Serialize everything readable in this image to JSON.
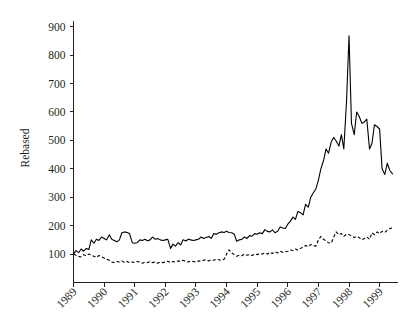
{
  "chart_data": {
    "type": "line",
    "title": "",
    "subtitle": "",
    "xlabel": "",
    "ylabel": "Rebased",
    "xlim": [
      1989.0,
      1999.6
    ],
    "ylim": [
      0,
      920
    ],
    "yticks": [
      100,
      200,
      300,
      400,
      500,
      600,
      700,
      800,
      900
    ],
    "ytick_labels": [
      "100",
      "200",
      "300",
      "400",
      "500",
      "600",
      "700",
      "800",
      "900"
    ],
    "xticks": [
      1989,
      1990,
      1991,
      1992,
      1993,
      1994,
      1995,
      1996,
      1997,
      1998,
      1999
    ],
    "xtick_labels": [
      "1989",
      "1990",
      "1991",
      "1992",
      "1993",
      "1994",
      "1995",
      "1996",
      "1997",
      "1998",
      "1999"
    ],
    "xtick_rotation_deg": 45,
    "grid": false,
    "legend": "none",
    "legend_position": "none",
    "annotations": [],
    "series": [
      {
        "name": "series-solid",
        "style": "solid",
        "color": "#000000",
        "x": [
          1989.0,
          1989.08,
          1989.17,
          1989.25,
          1989.33,
          1989.42,
          1989.5,
          1989.58,
          1989.67,
          1989.75,
          1989.83,
          1989.92,
          1990.0,
          1990.08,
          1990.17,
          1990.25,
          1990.33,
          1990.42,
          1990.5,
          1990.58,
          1990.67,
          1990.75,
          1990.83,
          1990.92,
          1991.0,
          1991.08,
          1991.17,
          1991.25,
          1991.33,
          1991.42,
          1991.5,
          1991.58,
          1991.67,
          1991.75,
          1991.83,
          1991.92,
          1992.0,
          1992.08,
          1992.17,
          1992.25,
          1992.33,
          1992.42,
          1992.5,
          1992.58,
          1992.67,
          1992.75,
          1992.83,
          1992.92,
          1993.0,
          1993.08,
          1993.17,
          1993.25,
          1993.33,
          1993.42,
          1993.5,
          1993.58,
          1993.67,
          1993.75,
          1993.83,
          1993.92,
          1994.0,
          1994.08,
          1994.17,
          1994.25,
          1994.33,
          1994.42,
          1994.5,
          1994.58,
          1994.67,
          1994.75,
          1994.83,
          1994.92,
          1995.0,
          1995.08,
          1995.17,
          1995.25,
          1995.33,
          1995.42,
          1995.5,
          1995.58,
          1995.67,
          1995.75,
          1995.83,
          1995.92,
          1996.0,
          1996.08,
          1996.17,
          1996.25,
          1996.33,
          1996.42,
          1996.5,
          1996.58,
          1996.67,
          1996.75,
          1996.83,
          1996.92,
          1997.0,
          1997.08,
          1997.17,
          1997.25,
          1997.33,
          1997.42,
          1997.5,
          1997.58,
          1997.67,
          1997.75,
          1997.83,
          1997.92,
          1998.0,
          1998.08,
          1998.17,
          1998.25,
          1998.33,
          1998.42,
          1998.5,
          1998.58,
          1998.67,
          1998.75,
          1998.83,
          1998.92,
          1999.0,
          1999.08,
          1999.17,
          1999.25,
          1999.33,
          1999.42
        ],
        "values": [
          100,
          112,
          105,
          118,
          110,
          120,
          116,
          150,
          138,
          152,
          148,
          160,
          155,
          150,
          168,
          152,
          148,
          143,
          150,
          175,
          178,
          176,
          172,
          140,
          138,
          140,
          150,
          148,
          152,
          147,
          150,
          160,
          152,
          155,
          150,
          148,
          150,
          152,
          120,
          135,
          128,
          140,
          132,
          150,
          146,
          152,
          150,
          148,
          150,
          152,
          160,
          155,
          158,
          162,
          155,
          172,
          170,
          175,
          178,
          176,
          180,
          176,
          175,
          170,
          145,
          150,
          152,
          160,
          155,
          165,
          163,
          172,
          170,
          175,
          172,
          186,
          180,
          178,
          185,
          175,
          180,
          195,
          192,
          190,
          205,
          215,
          230,
          222,
          250,
          245,
          238,
          275,
          265,
          300,
          315,
          330,
          360,
          400,
          430,
          470,
          455,
          495,
          510,
          498,
          480,
          520,
          470,
          640,
          868,
          560,
          520,
          600,
          585,
          560,
          565,
          575,
          470,
          490,
          555,
          548,
          540,
          400,
          380,
          420,
          395,
          382
        ]
      },
      {
        "name": "series-dashed",
        "style": "dashed",
        "color": "#000000",
        "x": [
          1989.0,
          1989.08,
          1989.17,
          1989.25,
          1989.33,
          1989.42,
          1989.5,
          1989.58,
          1989.67,
          1989.75,
          1989.83,
          1989.92,
          1990.0,
          1990.08,
          1990.17,
          1990.25,
          1990.33,
          1990.42,
          1990.5,
          1990.58,
          1990.67,
          1990.75,
          1990.83,
          1990.92,
          1991.0,
          1991.08,
          1991.17,
          1991.25,
          1991.33,
          1991.42,
          1991.5,
          1991.58,
          1991.67,
          1991.75,
          1991.83,
          1991.92,
          1992.0,
          1992.08,
          1992.17,
          1992.25,
          1992.33,
          1992.42,
          1992.5,
          1992.58,
          1992.67,
          1992.75,
          1992.83,
          1992.92,
          1993.0,
          1993.08,
          1993.17,
          1993.25,
          1993.33,
          1993.42,
          1993.5,
          1993.58,
          1993.67,
          1993.75,
          1993.83,
          1993.92,
          1994.0,
          1994.08,
          1994.17,
          1994.25,
          1994.33,
          1994.42,
          1994.5,
          1994.58,
          1994.67,
          1994.75,
          1994.83,
          1994.92,
          1995.0,
          1995.08,
          1995.17,
          1995.25,
          1995.33,
          1995.42,
          1995.5,
          1995.58,
          1995.67,
          1995.75,
          1995.83,
          1995.92,
          1996.0,
          1996.08,
          1996.17,
          1996.25,
          1996.33,
          1996.42,
          1996.5,
          1996.58,
          1996.67,
          1996.75,
          1996.83,
          1996.92,
          1997.0,
          1997.08,
          1997.17,
          1997.25,
          1997.33,
          1997.42,
          1997.5,
          1997.58,
          1997.67,
          1997.75,
          1997.83,
          1997.92,
          1998.0,
          1998.08,
          1998.17,
          1998.25,
          1998.33,
          1998.42,
          1998.5,
          1998.58,
          1998.67,
          1998.75,
          1998.83,
          1998.92,
          1999.0,
          1999.08,
          1999.17,
          1999.25,
          1999.33,
          1999.42
        ],
        "values": [
          100,
          96,
          92,
          90,
          98,
          94,
          100,
          96,
          92,
          88,
          95,
          90,
          86,
          82,
          78,
          72,
          70,
          74,
          72,
          76,
          70,
          74,
          70,
          72,
          70,
          74,
          72,
          68,
          72,
          70,
          74,
          70,
          72,
          68,
          72,
          70,
          72,
          75,
          70,
          74,
          72,
          76,
          74,
          78,
          74,
          72,
          76,
          74,
          72,
          76,
          74,
          78,
          80,
          76,
          80,
          78,
          82,
          80,
          78,
          82,
          100,
          115,
          104,
          98,
          92,
          96,
          94,
          100,
          96,
          98,
          95,
          100,
          98,
          102,
          100,
          104,
          100,
          106,
          102,
          108,
          104,
          110,
          106,
          108,
          110,
          115,
          112,
          118,
          114,
          120,
          125,
          130,
          126,
          134,
          130,
          128,
          150,
          162,
          152,
          146,
          140,
          138,
          160,
          178,
          168,
          172,
          162,
          170,
          168,
          165,
          158,
          162,
          158,
          150,
          155,
          160,
          152,
          175,
          168,
          178,
          172,
          180,
          176,
          185,
          190,
          192
        ]
      }
    ]
  }
}
